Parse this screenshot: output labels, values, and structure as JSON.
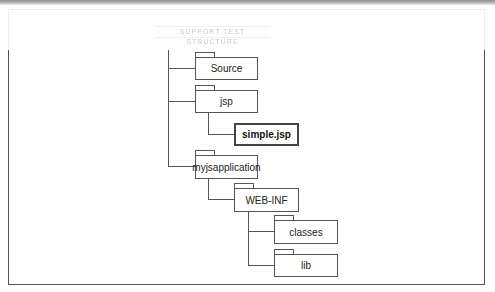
{
  "header": {
    "faded_caption": "SUPPORT TEST STRUCTURE"
  },
  "tree": {
    "nodes": [
      {
        "id": "source",
        "label": "Source",
        "type": "folder"
      },
      {
        "id": "jsp",
        "label": "jsp",
        "type": "folder"
      },
      {
        "id": "simple_jsp",
        "label": "simple.jsp",
        "type": "file"
      },
      {
        "id": "myjsapplication",
        "label": "myjsapplication",
        "type": "folder"
      },
      {
        "id": "web_inf",
        "label": "WEB-INF",
        "type": "folder"
      },
      {
        "id": "classes",
        "label": "classes",
        "type": "folder"
      },
      {
        "id": "lib",
        "label": "lib",
        "type": "folder"
      }
    ]
  },
  "colors": {
    "line": "#555555",
    "background": "#ffffff",
    "text": "#222222"
  }
}
